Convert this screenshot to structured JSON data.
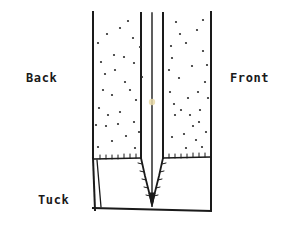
{
  "figure": {
    "type": "sewing-construction-diagram",
    "stroke_color": "#1a1a1a",
    "background_color": "#ffffff",
    "dot_color": "#2b2b2b",
    "accent_dot_color": "#e8d9a8"
  },
  "labels": {
    "back": "Back",
    "front": "Front",
    "tuck": "Tuck"
  },
  "geometry": {
    "panel": {
      "left_edge_x": 93,
      "right_edge_x": 211,
      "top_y": 12,
      "bottom_y": 210,
      "seam_y": 158
    },
    "pleat": {
      "fold_line_left_x": 141,
      "fold_line_center_x": 152,
      "fold_line_right_x": 163,
      "apex_x": 152,
      "apex_y": 205,
      "taper_start_y": 158
    },
    "tuck_region": {
      "top_y": 158,
      "bottom_y": 210,
      "left_dart_top_x": 96,
      "left_dart_bottom_x": 100
    }
  },
  "texture_dots": {
    "radius": 1.1,
    "back_panel": [
      [
        107,
        34
      ],
      [
        128,
        21
      ],
      [
        140,
        47
      ],
      [
        114,
        55
      ],
      [
        98,
        43
      ],
      [
        134,
        63
      ],
      [
        105,
        74
      ],
      [
        125,
        82
      ],
      [
        112,
        95
      ],
      [
        136,
        100
      ],
      [
        99,
        108
      ],
      [
        120,
        112
      ],
      [
        134,
        122
      ],
      [
        106,
        126
      ],
      [
        126,
        136
      ],
      [
        112,
        141
      ],
      [
        98,
        147
      ],
      [
        135,
        148
      ],
      [
        120,
        28
      ],
      [
        101,
        62
      ],
      [
        130,
        90
      ],
      [
        108,
        115
      ],
      [
        139,
        132
      ],
      [
        115,
        70
      ],
      [
        124,
        57
      ],
      [
        103,
        90
      ],
      [
        133,
        38
      ],
      [
        118,
        124
      ],
      [
        96,
        125
      ],
      [
        142,
        77
      ]
    ],
    "front_panel": [
      [
        176,
        22
      ],
      [
        197,
        30
      ],
      [
        186,
        43
      ],
      [
        203,
        51
      ],
      [
        172,
        58
      ],
      [
        192,
        66
      ],
      [
        179,
        78
      ],
      [
        205,
        82
      ],
      [
        170,
        92
      ],
      [
        188,
        98
      ],
      [
        200,
        110
      ],
      [
        175,
        115
      ],
      [
        193,
        126
      ],
      [
        206,
        132
      ],
      [
        172,
        137
      ],
      [
        186,
        148
      ],
      [
        202,
        147
      ],
      [
        180,
        34
      ],
      [
        198,
        92
      ],
      [
        169,
        70
      ],
      [
        207,
        65
      ],
      [
        190,
        115
      ],
      [
        174,
        104
      ],
      [
        203,
        20
      ],
      [
        184,
        134
      ],
      [
        196,
        140
      ],
      [
        171,
        46
      ],
      [
        208,
        98
      ],
      [
        181,
        110
      ],
      [
        199,
        122
      ]
    ],
    "accent_dot": [
      152,
      102
    ]
  }
}
